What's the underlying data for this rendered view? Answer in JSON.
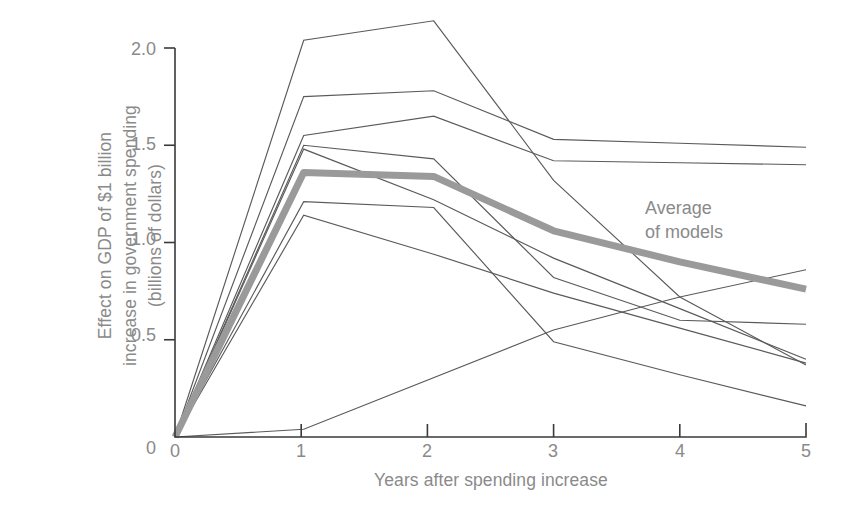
{
  "figure": {
    "background_color": "#ffffff",
    "axis_color": "#3a3a3a",
    "text_color": "#8a8a8a",
    "model_line_color": "#5a5a5a",
    "average_line_color": "#9a9a9a"
  },
  "axis": {
    "ylabel_line1": "Effect on GDP of $1 billion",
    "ylabel_line2": "increase in government spending",
    "ylabel_line3": "(billions of dollars)",
    "xlabel": "Years after spending increase",
    "yticks": [
      "2.0",
      "1.5",
      "1.0",
      "0.5",
      "0"
    ],
    "xticks": [
      "0",
      "1",
      "2",
      "3",
      "4",
      "5"
    ]
  },
  "annotation": {
    "line1": "Average",
    "line2": "of models"
  },
  "chart_data": {
    "type": "line",
    "title": "",
    "xlabel": "Years after spending increase",
    "ylabel": "Effect on GDP of $1 billion increase in government spending (billions of dollars)",
    "xlim": [
      0,
      5
    ],
    "ylim": [
      0,
      2.2
    ],
    "grid": false,
    "legend_position": "inline-annotation",
    "yticks": [
      0,
      0.5,
      1.0,
      1.5,
      2.0
    ],
    "xticks": [
      0,
      1,
      2,
      3,
      4,
      5
    ],
    "series": [
      {
        "name": "Model 1",
        "style": "thin",
        "x": [
          0,
          1.02,
          2.05,
          3,
          4,
          5
        ],
        "values": [
          0,
          2.04,
          2.14,
          1.32,
          0.72,
          0.37
        ]
      },
      {
        "name": "Model 2",
        "style": "thin",
        "x": [
          0,
          1.02,
          2.05,
          3,
          4,
          5
        ],
        "values": [
          0,
          1.75,
          1.78,
          1.53,
          1.51,
          1.49
        ]
      },
      {
        "name": "Model 3",
        "style": "thin",
        "x": [
          0,
          1.02,
          2.05,
          3,
          4,
          5
        ],
        "values": [
          0,
          1.55,
          1.65,
          1.42,
          1.41,
          1.4
        ]
      },
      {
        "name": "Model 4",
        "style": "thin",
        "x": [
          0,
          1.02,
          2.05,
          3,
          4,
          5
        ],
        "values": [
          0,
          1.5,
          1.43,
          0.82,
          0.6,
          0.58
        ]
      },
      {
        "name": "Model 5",
        "style": "thin",
        "x": [
          0,
          1.02,
          2.05,
          3,
          4,
          5
        ],
        "values": [
          0,
          1.48,
          1.22,
          0.92,
          0.66,
          0.4
        ]
      },
      {
        "name": "Model 6",
        "style": "thin",
        "x": [
          0,
          1.02,
          2.05,
          3,
          4,
          5
        ],
        "values": [
          0,
          1.21,
          1.18,
          0.49,
          0.32,
          0.16
        ]
      },
      {
        "name": "Model 7",
        "style": "thin",
        "x": [
          0,
          1.02,
          2.05,
          3,
          4,
          5
        ],
        "values": [
          0,
          1.14,
          0.94,
          0.74,
          0.56,
          0.38
        ]
      },
      {
        "name": "Model 8",
        "style": "thin",
        "x": [
          0,
          1.02,
          3,
          4,
          5
        ],
        "values": [
          0,
          0.04,
          0.55,
          0.72,
          0.86
        ]
      },
      {
        "name": "Average of models",
        "style": "thick",
        "x": [
          0,
          1.02,
          2.05,
          3,
          4,
          5
        ],
        "values": [
          0,
          1.36,
          1.34,
          1.06,
          0.9,
          0.76
        ]
      }
    ]
  }
}
